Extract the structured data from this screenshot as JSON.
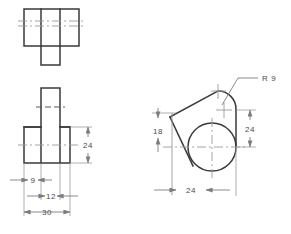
{
  "drawing": {
    "title": "Orthographic Projection - Three View Engineering Drawing",
    "units": "mm",
    "line_colors": {
      "object": "#3a3a3a",
      "center": "#9a9a9a",
      "hidden": "#5a5a5a",
      "dimension": "#7d7d7d",
      "extension": "#9d9d9d",
      "text": "#4a4a4a",
      "background": "#ffffff"
    },
    "views": [
      {
        "id": "top-view",
        "name": "Top View",
        "description": "Rectangular plan outline with two internal vertical edges and a projecting lower tongue, horizontal centerlines across"
      },
      {
        "id": "front-view",
        "name": "Front View",
        "description": "Inverted T shape: wide base block with narrower central upright, hidden line and centerlines shown"
      },
      {
        "id": "right-side-view",
        "name": "Right Side View",
        "description": "Large circle tangent to an inclined polygon with a small radius arc at the upper right"
      }
    ],
    "dimensions": [
      {
        "id": "dim-front-height-24",
        "value": "24",
        "view": "front-view",
        "orientation": "vertical"
      },
      {
        "id": "dim-front-9",
        "value": "9",
        "view": "front-view",
        "orientation": "horizontal"
      },
      {
        "id": "dim-front-12",
        "value": "12",
        "view": "front-view",
        "orientation": "horizontal"
      },
      {
        "id": "dim-front-30",
        "value": "30",
        "view": "front-view",
        "orientation": "horizontal"
      },
      {
        "id": "dim-side-18",
        "value": "18",
        "view": "right-side-view",
        "orientation": "vertical"
      },
      {
        "id": "dim-side-24-vertical",
        "value": "24",
        "view": "right-side-view",
        "orientation": "vertical"
      },
      {
        "id": "dim-side-24-horizontal",
        "value": "24",
        "view": "right-side-view",
        "orientation": "horizontal"
      },
      {
        "id": "dim-side-radius",
        "value": "R 9",
        "view": "right-side-view",
        "orientation": "leader"
      }
    ],
    "labels": {
      "front_height": "24",
      "front_nine": "9",
      "front_twelve": "12",
      "front_thirty": "30",
      "side_eighteen": "18",
      "side_height": "24",
      "side_width": "24",
      "radius": "R 9",
      "cutoff_row": ""
    }
  }
}
